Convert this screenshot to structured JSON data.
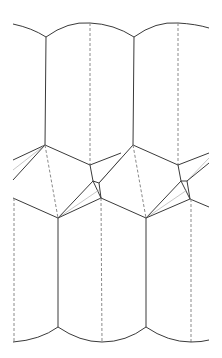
{
  "diagram": {
    "type": "crease-pattern",
    "colors": {
      "mountain": "#3a3a3a",
      "valley": "#8a8a8a",
      "auxiliary": "#b8b8b8",
      "background": "#ffffff"
    },
    "unit_offset_x": 88,
    "units": 2
  }
}
